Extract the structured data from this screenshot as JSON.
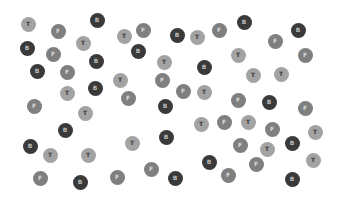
{
  "legend": {
    "T": {
      "label": "T",
      "color": "#a3a3a3"
    },
    "F": {
      "label": "F",
      "color": "#7f7f7f"
    },
    "B": {
      "label": "B",
      "color": "#3a3a3a"
    }
  },
  "dots": [
    {
      "t": "T",
      "x": 28,
      "y": 24
    },
    {
      "t": "F",
      "x": 58,
      "y": 31
    },
    {
      "t": "B",
      "x": 97,
      "y": 20
    },
    {
      "t": "T",
      "x": 83,
      "y": 43
    },
    {
      "t": "T",
      "x": 124,
      "y": 36
    },
    {
      "t": "F",
      "x": 143,
      "y": 30
    },
    {
      "t": "B",
      "x": 177,
      "y": 35
    },
    {
      "t": "T",
      "x": 197,
      "y": 37
    },
    {
      "t": "F",
      "x": 219,
      "y": 30
    },
    {
      "t": "B",
      "x": 244,
      "y": 22
    },
    {
      "t": "F",
      "x": 275,
      "y": 41
    },
    {
      "t": "B",
      "x": 298,
      "y": 30
    },
    {
      "t": "B",
      "x": 27,
      "y": 48
    },
    {
      "t": "F",
      "x": 53,
      "y": 54
    },
    {
      "t": "B",
      "x": 138,
      "y": 51
    },
    {
      "t": "T",
      "x": 164,
      "y": 62
    },
    {
      "t": "B",
      "x": 96,
      "y": 61
    },
    {
      "t": "T",
      "x": 238,
      "y": 55
    },
    {
      "t": "F",
      "x": 305,
      "y": 55
    },
    {
      "t": "B",
      "x": 37,
      "y": 71
    },
    {
      "t": "F",
      "x": 67,
      "y": 72
    },
    {
      "t": "B",
      "x": 204,
      "y": 67
    },
    {
      "t": "T",
      "x": 253,
      "y": 75
    },
    {
      "t": "T",
      "x": 281,
      "y": 74
    },
    {
      "t": "T",
      "x": 120,
      "y": 80
    },
    {
      "t": "F",
      "x": 162,
      "y": 80
    },
    {
      "t": "B",
      "x": 95,
      "y": 88
    },
    {
      "t": "T",
      "x": 67,
      "y": 93
    },
    {
      "t": "F",
      "x": 128,
      "y": 98
    },
    {
      "t": "F",
      "x": 183,
      "y": 91
    },
    {
      "t": "T",
      "x": 204,
      "y": 92
    },
    {
      "t": "B",
      "x": 165,
      "y": 106
    },
    {
      "t": "F",
      "x": 238,
      "y": 100
    },
    {
      "t": "B",
      "x": 269,
      "y": 102
    },
    {
      "t": "F",
      "x": 305,
      "y": 108
    },
    {
      "t": "F",
      "x": 34,
      "y": 106
    },
    {
      "t": "T",
      "x": 85,
      "y": 113
    },
    {
      "t": "B",
      "x": 65,
      "y": 130
    },
    {
      "t": "T",
      "x": 201,
      "y": 124
    },
    {
      "t": "F",
      "x": 224,
      "y": 122
    },
    {
      "t": "T",
      "x": 248,
      "y": 122
    },
    {
      "t": "F",
      "x": 272,
      "y": 129
    },
    {
      "t": "T",
      "x": 315,
      "y": 132
    },
    {
      "t": "F",
      "x": 240,
      "y": 145
    },
    {
      "t": "T",
      "x": 267,
      "y": 149
    },
    {
      "t": "B",
      "x": 292,
      "y": 143
    },
    {
      "t": "B",
      "x": 166,
      "y": 137
    },
    {
      "t": "B",
      "x": 30,
      "y": 146
    },
    {
      "t": "T",
      "x": 50,
      "y": 155
    },
    {
      "t": "T",
      "x": 88,
      "y": 155
    },
    {
      "t": "T",
      "x": 132,
      "y": 143
    },
    {
      "t": "F",
      "x": 40,
      "y": 178
    },
    {
      "t": "B",
      "x": 80,
      "y": 182
    },
    {
      "t": "F",
      "x": 117,
      "y": 177
    },
    {
      "t": "F",
      "x": 151,
      "y": 169
    },
    {
      "t": "B",
      "x": 175,
      "y": 178
    },
    {
      "t": "B",
      "x": 209,
      "y": 162
    },
    {
      "t": "F",
      "x": 228,
      "y": 175
    },
    {
      "t": "F",
      "x": 256,
      "y": 164
    },
    {
      "t": "T",
      "x": 313,
      "y": 160
    },
    {
      "t": "B",
      "x": 292,
      "y": 179
    }
  ]
}
